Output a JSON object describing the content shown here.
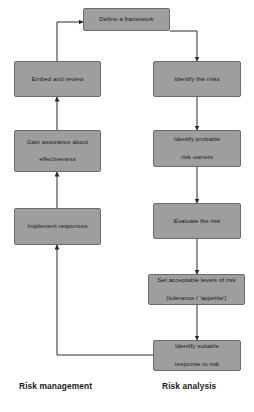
{
  "diagram": {
    "background_color": "#ffffff",
    "node_fill_color": "#9e9e9e",
    "node_border_color": "#6b6b6b",
    "edge_color": "#2b2b2b",
    "text_color": "#1a1a1a",
    "nodes": {
      "define_framework": "Define a framework",
      "identify_risks": "Identify the risks",
      "identify_probable_owners_line1": "Identify probable",
      "identify_probable_owners_line2": "risk owners",
      "evaluate_risk": "Evaluate the risk",
      "set_levels_line1": "Set acceptable levels of risk",
      "set_levels_line2": "(tolerance / 'appetite')",
      "identify_response_line1": "Identify suitable",
      "identify_response_line2": "response to risk",
      "implement_responses": "Implement responses",
      "gain_assurance_line1": "Gain assurance about",
      "gain_assurance_line2": "effectiveness",
      "embed_and_review": "Embed and review"
    },
    "captions": {
      "left": "Risk management",
      "right": "Risk analysis"
    }
  }
}
